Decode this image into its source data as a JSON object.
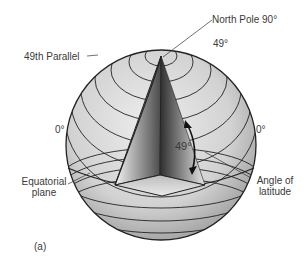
{
  "diagram": {
    "labels": {
      "north_pole": "North Pole  90°",
      "lat_49_top": "49°",
      "parallel_49": "49th Parallel",
      "left_zero": "0°",
      "right_zero": "0°",
      "angle_value": "49°",
      "equatorial_plane_1": "Equatorial",
      "equatorial_plane_2": "plane",
      "angle_of_latitude_1": "Angle of",
      "angle_of_latitude_2": "latitude",
      "figure_tag": "(a)"
    },
    "colors": {
      "globe_fill": "#d9d9d9",
      "lines": "#222222",
      "wedge_dark": "#3a3a3a",
      "wedge_light": "#f0f0f0"
    }
  }
}
